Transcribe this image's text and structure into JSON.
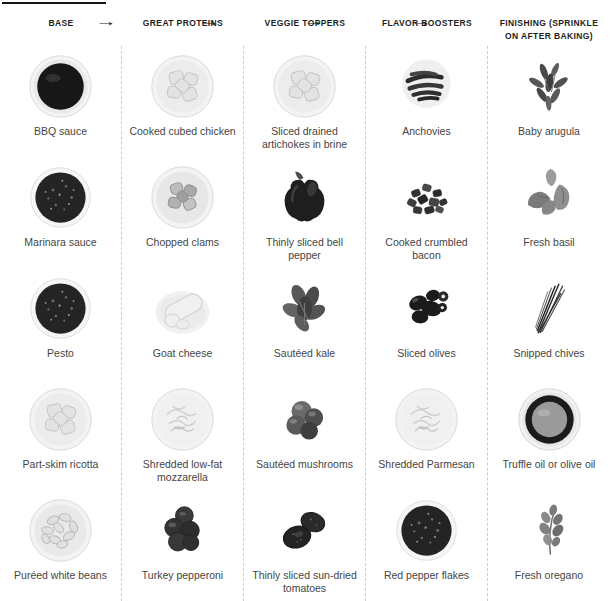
{
  "header": {
    "arrow_glyph": "→"
  },
  "columns": [
    {
      "title": "BASE",
      "items": [
        {
          "label": "BBQ sauce",
          "icon": "dark-sauce-bowl"
        },
        {
          "label": "Marinara sauce",
          "icon": "speckled-sauce-bowl"
        },
        {
          "label": "Pesto",
          "icon": "speckled-sauce-bowl"
        },
        {
          "label": "Part-skim ricotta",
          "icon": "light-chunks-bowl"
        },
        {
          "label": "Puréed white beans",
          "icon": "beans-bowl"
        }
      ]
    },
    {
      "title": "GREAT PROTEINS",
      "items": [
        {
          "label": "Cooked cubed chicken",
          "icon": "light-chunks-bowl"
        },
        {
          "label": "Chopped clams",
          "icon": "gray-chunks-bowl"
        },
        {
          "label": "Goat cheese",
          "icon": "cheese-log"
        },
        {
          "label": "Shredded low-fat mozzarella",
          "icon": "shreds-bowl"
        },
        {
          "label": "Turkey pepperoni",
          "icon": "pepperoni-slices"
        }
      ]
    },
    {
      "title": "VEGGIE TOPPERS",
      "items": [
        {
          "label": "Sliced drained artichokes in brine",
          "icon": "light-chunks-bowl"
        },
        {
          "label": "Thinly sliced bell pepper",
          "icon": "bell-pepper"
        },
        {
          "label": "Sautéed kale",
          "icon": "kale-leaves"
        },
        {
          "label": "Sautéed mushrooms",
          "icon": "mushrooms"
        },
        {
          "label": "Thinly sliced sun-dried tomatoes",
          "icon": "dried-tomatoes"
        }
      ]
    },
    {
      "title": "FLAVOR BOOSTERS",
      "items": [
        {
          "label": "Anchovies",
          "icon": "anchovies"
        },
        {
          "label": "Cooked crumbled bacon",
          "icon": "bacon-crumbles"
        },
        {
          "label": "Sliced olives",
          "icon": "olives"
        },
        {
          "label": "Shredded Parmesan",
          "icon": "shreds-bowl"
        },
        {
          "label": "Red pepper flakes",
          "icon": "speckled-sauce-bowl"
        }
      ]
    },
    {
      "title": "FINISHING (SPRINKLE ON AFTER BAKING)",
      "items": [
        {
          "label": "Baby arugula",
          "icon": "arugula-leaves"
        },
        {
          "label": "Fresh basil",
          "icon": "basil-leaves"
        },
        {
          "label": "Snipped chives",
          "icon": "chives"
        },
        {
          "label": "Truffle oil or olive oil",
          "icon": "oil-bowl"
        },
        {
          "label": "Fresh oregano",
          "icon": "oregano-sprig"
        }
      ]
    }
  ],
  "colors": {
    "header_text": "#1d1d1d",
    "label_text": "#454545",
    "divider": "#cccccc",
    "top_rule": "#161616"
  }
}
